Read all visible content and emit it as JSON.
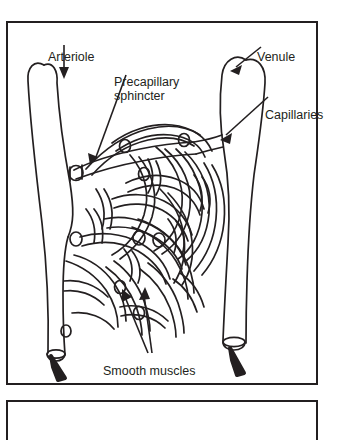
{
  "figure": {
    "name": "capillary-bed-diagram",
    "stroke_color": "#231f20",
    "background_color": "#ffffff",
    "border_color": "#231f20",
    "labels": {
      "arteriole": "Arteriole",
      "precapillary_sphincter_line1": "Precapillary",
      "precapillary_sphincter_line2": "sphincter",
      "venule": "Venule",
      "capillaries": "Capillaries",
      "smooth_muscles": "Smooth muscles"
    },
    "annotations": [
      {
        "label": "Arteriole",
        "target": "left inflow vessel",
        "leader": "vertical arrow pointing down into vessel lumen"
      },
      {
        "label": "Precapillary sphincter",
        "target": "ring on capillary branch",
        "leader": "diagonal arrow pointing down-left"
      },
      {
        "label": "Venule",
        "target": "right outflow vessel",
        "leader": "diagonal arrow pointing down-left"
      },
      {
        "label": "Capillaries",
        "target": "capillary network",
        "leader": "long diagonal arrow pointing down-left"
      },
      {
        "label": "Smooth muscles",
        "target": "two sphincter rings",
        "leader": "two arrows pointing up"
      }
    ],
    "flow_arrows": [
      {
        "position": "bottom-left",
        "direction": "down-out",
        "vessel": "arteriole continuation"
      },
      {
        "position": "bottom-right",
        "direction": "down-out",
        "vessel": "venule continuation"
      }
    ]
  },
  "second_panel": {
    "name": "adjacent-figure-box",
    "content": ""
  }
}
